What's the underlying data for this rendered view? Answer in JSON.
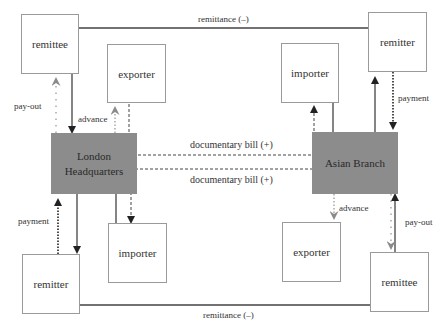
{
  "diagram": {
    "title": "",
    "hubs": {
      "london": {
        "label_line1": "London",
        "label_line2": "Headquarters"
      },
      "asian": {
        "label": "Asian Branch"
      }
    },
    "boxes": {
      "tl_remittee": "remittee",
      "tl_exporter": "exporter",
      "bl_importer": "importer",
      "bl_remitter": "remitter",
      "tr_importer": "importer",
      "tr_remitter": "remitter",
      "br_exporter": "exporter",
      "br_remittee": "remittee"
    },
    "edge_labels": {
      "remittance_top": "remittance (–)",
      "remittance_bottom": "remittance (–)",
      "doc_bill_top": "documentary bill (+)",
      "doc_bill_bottom": "documentary bill (+)",
      "payout_left": "pay-out",
      "advance_left": "advance",
      "payment_left": "payment",
      "payment_right": "payment",
      "advance_right": "advance",
      "payout_right": "pay-out"
    },
    "colors": {
      "hub_fill": "#8c8c8c",
      "box_border": "#9a9a9a",
      "solid_line": "#333333",
      "grey_arrow": "#8a8a8a"
    }
  }
}
